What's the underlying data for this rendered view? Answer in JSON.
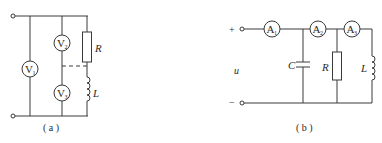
{
  "figure_a": {
    "caption": "( a )",
    "meters": [
      {
        "letter": "V",
        "sub": "1"
      },
      {
        "letter": "V",
        "sub": "2"
      },
      {
        "letter": "V",
        "sub": "3"
      }
    ],
    "components": {
      "resistor": "R",
      "inductor": "L"
    }
  },
  "figure_b": {
    "caption": "( b )",
    "source": {
      "plus": "+",
      "minus": "−",
      "voltage": "u"
    },
    "meters": [
      {
        "letter": "A",
        "sub": "1"
      },
      {
        "letter": "A",
        "sub": "2"
      },
      {
        "letter": "A",
        "sub": "3"
      }
    ],
    "components": {
      "capacitor": "C",
      "resistor": "R",
      "inductor": "L"
    }
  },
  "colors": {
    "line": "#3a3a3a",
    "background": "#ffffff"
  }
}
